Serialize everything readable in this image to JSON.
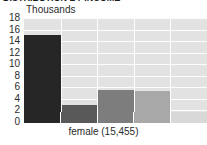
{
  "title_sliver": "DISTRIBUTION BY INCOME",
  "chart_data": {
    "type": "bar",
    "title": "",
    "xlabel": "female (15,455)",
    "ylabel": "Thousands",
    "unit_caption": "Thousands",
    "ylim": [
      0,
      18
    ],
    "yticks": [
      18,
      16,
      14,
      12,
      10,
      8,
      6,
      4,
      2,
      0
    ],
    "ytick_labels": [
      "18",
      "16",
      "14",
      "12",
      "10",
      "8",
      "6",
      "4",
      "2",
      "0"
    ],
    "grid": true,
    "grid_color": "#fdfdfd",
    "plot_background": "#e2e2e2",
    "legend_position": "bottom",
    "categories": [
      "1",
      "2",
      "3",
      "4",
      "5"
    ],
    "values": [
      15.0,
      3.0,
      5.5,
      5.3,
      0.0
    ],
    "bar_colors": [
      "#262626",
      "#595959",
      "#7d7d7d",
      "#a8a8a8",
      "#d8d8d8"
    ],
    "series": [
      {
        "name": "female",
        "values": [
          15.0,
          3.0,
          5.5,
          5.3,
          0.0
        ]
      }
    ],
    "legend_swatches": [
      "#262626",
      "#595959",
      "#7d7d7d",
      "#a8a8a8",
      "#d8d8d8"
    ]
  }
}
